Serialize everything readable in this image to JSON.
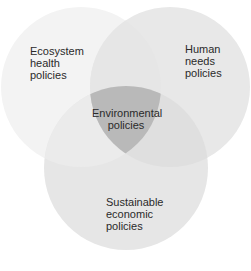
{
  "diagram": {
    "type": "venn-3",
    "colors": {
      "background": "#ffffff",
      "circle_left": "#f3f3f3",
      "circle_right": "#e8e8e8",
      "circle_bottom": "#e5e5e5",
      "overlap_left_right": "#e4e4e4",
      "overlap_left_bottom": "#e9e9e9",
      "overlap_right_bottom": "#dedede",
      "center": "#b9b9b9",
      "text": "#2a2a2a"
    },
    "sets": [
      {
        "id": "left",
        "lines": [
          "Ecosystem",
          "health",
          "policies"
        ]
      },
      {
        "id": "right",
        "lines": [
          "Human",
          "needs",
          "policies"
        ]
      },
      {
        "id": "bottom",
        "lines": [
          "Sustainable",
          "economic",
          "policies"
        ]
      }
    ],
    "center": {
      "lines": [
        "Environmental",
        "policies"
      ]
    }
  }
}
